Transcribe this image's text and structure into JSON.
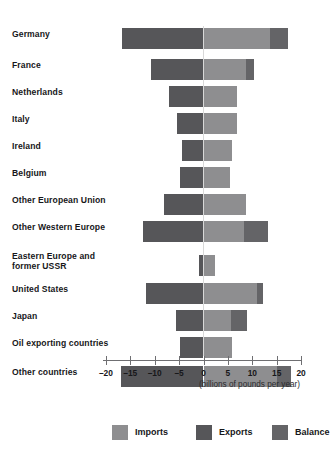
{
  "chart_data": {
    "type": "bar",
    "orientation": "horizontal",
    "title": "",
    "subtitle": "",
    "xlabel": "(billions of pounds per year)",
    "ylabel": "",
    "xlim": [
      -20,
      20
    ],
    "xticks": [
      -20,
      -15,
      -10,
      -5,
      0,
      5,
      10,
      15,
      20
    ],
    "xtick_labels": [
      "–20",
      "–15",
      "–10",
      "–5",
      "0",
      "5",
      "10",
      "15",
      "20"
    ],
    "grid": false,
    "legend_position": "bottom",
    "categories": [
      "Germany",
      "France",
      "Netherlands",
      "Italy",
      "Ireland",
      "Belgium",
      "Other European Union",
      "Other Western Europe",
      "Eastern Europe and former USSR",
      "United States",
      "Japan",
      "Oil exporting countries",
      "Other countries"
    ],
    "series": [
      {
        "name": "Exports",
        "color": "#565659",
        "values": [
          -16.7,
          -10.8,
          -7.0,
          -5.5,
          -4.4,
          -4.8,
          -8.0,
          -12.4,
          -1.0,
          -11.7,
          -5.6,
          -4.8,
          -17.0
        ]
      },
      {
        "name": "Imports",
        "color": "#8e8e90",
        "values": [
          17.4,
          10.4,
          6.8,
          6.9,
          5.9,
          5.5,
          8.8,
          13.2,
          2.4,
          12.2,
          9.0,
          5.8,
          18.0
        ]
      },
      {
        "name": "Balance",
        "color": "#646467",
        "values": [
          3.7,
          1.6,
          0.0,
          0.0,
          0.0,
          0.0,
          0.0,
          4.8,
          0.0,
          1.3,
          3.4,
          0.0,
          2.9
        ]
      }
    ],
    "legend": [
      {
        "label": "Imports",
        "color": "#8e8e90"
      },
      {
        "label": "Exports",
        "color": "#565659"
      },
      {
        "label": "Balance",
        "color": "#646467"
      }
    ]
  },
  "axis": {
    "caption": "(billions of pounds per year)"
  }
}
